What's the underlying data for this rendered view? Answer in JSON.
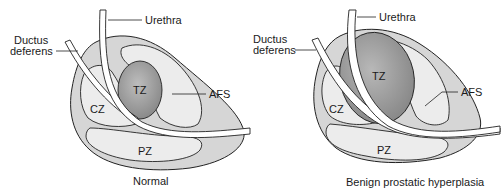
{
  "diagrams": [
    {
      "caption": "Normal",
      "labels": {
        "urethra": "Urethra",
        "ductus_line1": "Ductus",
        "ductus_line2": "deferens",
        "tz": "TZ",
        "cz": "CZ",
        "pz": "PZ",
        "afs": "AFS"
      }
    },
    {
      "caption": "Benign prostatic hyperplasia",
      "labels": {
        "urethra": "Urethra",
        "ductus_line1": "Ductus",
        "ductus_line2": "deferens",
        "tz": "TZ",
        "cz": "CZ",
        "pz": "PZ",
        "afs": "AFS"
      }
    }
  ],
  "colors": {
    "outer_fill": "#d9d9d9",
    "inner_fill": "#ececec",
    "tz_fill": "#9a9a9a",
    "stroke": "#222222",
    "tube_fill": "#ffffff"
  }
}
